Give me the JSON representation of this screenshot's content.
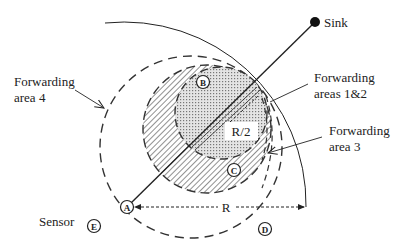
{
  "diagram": {
    "sink_label": "Sink",
    "sensor_legend_label": "Sensor",
    "labels": {
      "area4": [
        "Forwarding",
        "area 4"
      ],
      "areas12": [
        "Forwarding",
        "areas 1&2"
      ],
      "area3": [
        "Forwarding",
        "area 3"
      ],
      "half_radius": "R/2",
      "radius": "R"
    },
    "nodes": [
      {
        "id": "A",
        "role": "source sensor"
      },
      {
        "id": "B",
        "role": "sensor"
      },
      {
        "id": "C",
        "role": "sensor"
      },
      {
        "id": "D",
        "role": "sensor"
      },
      {
        "id": "E",
        "role": "sensor legend"
      }
    ],
    "colors": {
      "stroke": "#222222",
      "hatch": "#555555",
      "dots": "#777777"
    }
  }
}
